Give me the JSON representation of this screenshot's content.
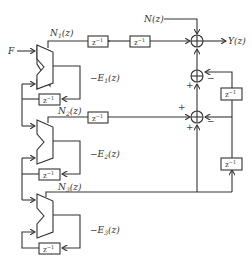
{
  "diagram": {
    "title": "",
    "input_label": "F",
    "noise_label": "N(z)",
    "output_label": "Y(z)",
    "stages": [
      {
        "id": 1,
        "output_label": "N1(z)",
        "error_label": "-E1(z)",
        "delay_label": "z^-1"
      },
      {
        "id": 2,
        "output_label": "N2(z)",
        "error_label": "-E2(z)",
        "delay_label": "z^-1"
      },
      {
        "id": 3,
        "output_label": "N3(z)",
        "error_label": "-E3(z)",
        "delay_label": "z^-1"
      }
    ],
    "delay_blocks": [
      "z^-1",
      "z^-1",
      "z^-1",
      "z^-1",
      "z^-1",
      "z^-1",
      "z^-1",
      "z^-1"
    ],
    "summers": [
      {
        "id": "sum-top",
        "signs": [
          "+",
          "+",
          "+"
        ]
      },
      {
        "id": "sum-mid",
        "signs": [
          "+",
          "-"
        ]
      },
      {
        "id": "sum-low",
        "signs": [
          "+",
          "+",
          "-"
        ]
      }
    ],
    "sign_plus": "+",
    "sign_minus": "−",
    "colors": {
      "line": "#333333",
      "background": "#ffffff"
    }
  }
}
